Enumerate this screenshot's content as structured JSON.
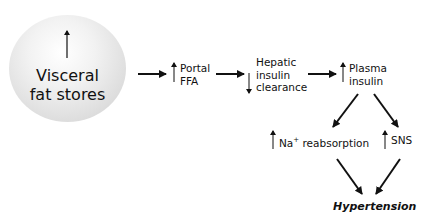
{
  "diagram": {
    "title": "",
    "nodes": {
      "visceral": {
        "line1": "Visceral",
        "line2": "fat stores",
        "change": "increase"
      },
      "portal_ffa": {
        "line1": "Portal",
        "line2": "FFA",
        "change": "increase"
      },
      "hepatic": {
        "line1": "Hepatic",
        "line2": "insulin",
        "line3": "clearance",
        "change": "decrease"
      },
      "plasma": {
        "line1": "Plasma",
        "line2": "insulin",
        "change": "increase"
      },
      "na": {
        "prefix": "Na",
        "sup": "+",
        "suffix": " reabsorption",
        "change": "increase"
      },
      "sns": {
        "label": "SNS",
        "change": "increase"
      },
      "hypertension": {
        "label": "Hypertension"
      }
    },
    "edges": [
      [
        "visceral",
        "portal_ffa"
      ],
      [
        "portal_ffa",
        "hepatic"
      ],
      [
        "hepatic",
        "plasma"
      ],
      [
        "plasma",
        "na"
      ],
      [
        "plasma",
        "sns"
      ],
      [
        "na",
        "hypertension"
      ],
      [
        "sns",
        "hypertension"
      ]
    ],
    "colors": {
      "circle": "#dcdcdc",
      "text": "#111111",
      "background": "#ffffff"
    }
  }
}
